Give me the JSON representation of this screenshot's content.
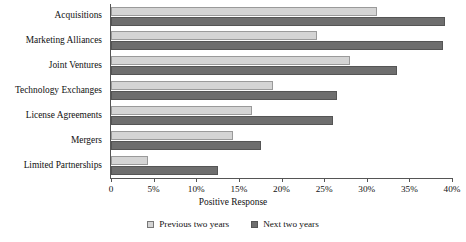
{
  "chart_data": {
    "type": "bar",
    "orientation": "horizontal",
    "title": "",
    "xlabel": "Positive Response",
    "ylabel": "",
    "xlim": [
      0,
      40
    ],
    "grid": false,
    "legend_position": "bottom",
    "tick_labels": [
      "0",
      "5%",
      "10%",
      "15%",
      "20%",
      "25%",
      "30%",
      "35%",
      "40%"
    ],
    "tick_values": [
      0,
      5,
      10,
      15,
      20,
      25,
      30,
      35,
      40
    ],
    "categories": [
      "Acquisitions",
      "Marketing Alliances",
      "Joint Ventures",
      "Technology Exchanges",
      "License Agreements",
      "Mergers",
      "Limited Partnerships"
    ],
    "series": [
      {
        "name": "Previous two years",
        "color": "#d4d4d4",
        "values": [
          31.2,
          24.2,
          28.0,
          19.0,
          16.5,
          14.3,
          4.3
        ]
      },
      {
        "name": "Next two years",
        "color": "#6e6e6e",
        "values": [
          39.2,
          39.0,
          33.5,
          26.5,
          26.0,
          17.6,
          12.6
        ]
      }
    ]
  }
}
